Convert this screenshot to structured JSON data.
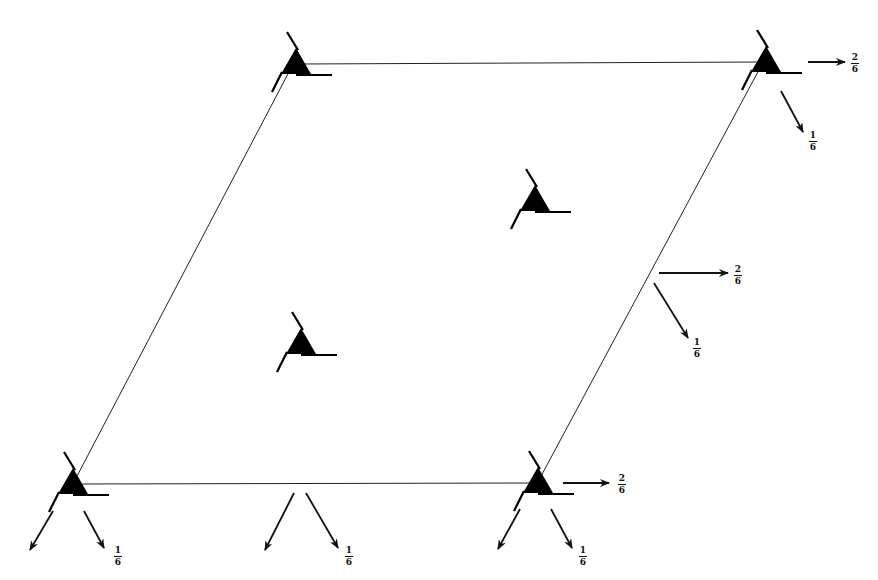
{
  "diagram": {
    "type": "lattice-cell-symmetry",
    "cell": {
      "corners": {
        "top_left": [
          291,
          64
        ],
        "top_right": [
          763,
          64
        ],
        "bottom_right": [
          535,
          484
        ],
        "bottom_left": [
          72,
          484
        ]
      },
      "stroke_color": "#222222"
    },
    "symmetry_markers": [
      {
        "id": "corner-top-left",
        "position": [
          295,
          62
        ]
      },
      {
        "id": "corner-top-right",
        "position": [
          765,
          62
        ]
      },
      {
        "id": "corner-bottom-left",
        "position": [
          72,
          482
        ]
      },
      {
        "id": "corner-bottom-right",
        "position": [
          537,
          482
        ]
      },
      {
        "id": "interior-upper",
        "position": [
          534,
          200
        ]
      },
      {
        "id": "interior-lower",
        "position": [
          300,
          342
        ]
      }
    ],
    "vectors": [
      {
        "id": "tr-horizontal",
        "from": [
          808,
          62
        ],
        "to": [
          845,
          62
        ],
        "label": {
          "num": "2",
          "den": "6"
        },
        "label_pos": [
          850,
          55
        ]
      },
      {
        "id": "tr-diagonal",
        "from": [
          781,
          91
        ],
        "to": [
          803,
          132
        ],
        "label": {
          "num": "1",
          "den": "6"
        },
        "label_pos": [
          808,
          135
        ]
      },
      {
        "id": "mid-horizontal",
        "from": [
          659,
          273
        ],
        "to": [
          728,
          273
        ],
        "label": {
          "num": "2",
          "den": "6"
        },
        "label_pos": [
          733,
          266
        ]
      },
      {
        "id": "mid-diagonal",
        "from": [
          654,
          283
        ],
        "to": [
          688,
          338
        ],
        "label": {
          "num": "1",
          "den": "6"
        },
        "label_pos": [
          692,
          341
        ]
      },
      {
        "id": "bl-left",
        "from": [
          53,
          511
        ],
        "to": [
          30,
          550
        ],
        "label": null
      },
      {
        "id": "bl-right",
        "from": [
          84,
          511
        ],
        "to": [
          104,
          548
        ],
        "label": {
          "num": "1",
          "den": "6"
        },
        "label_pos": [
          113,
          549
        ]
      },
      {
        "id": "bm-left",
        "from": [
          294,
          493
        ],
        "to": [
          265,
          550
        ],
        "label": null
      },
      {
        "id": "bm-right",
        "from": [
          306,
          493
        ],
        "to": [
          338,
          548
        ],
        "label": {
          "num": "1",
          "den": "6"
        },
        "label_pos": [
          344,
          549
        ]
      },
      {
        "id": "br-horizontal",
        "from": [
          563,
          483
        ],
        "to": [
          609,
          483
        ],
        "label": {
          "num": "2",
          "den": "6"
        },
        "label_pos": [
          617,
          476
        ]
      },
      {
        "id": "br-left",
        "from": [
          520,
          509
        ],
        "to": [
          498,
          549
        ],
        "label": null
      },
      {
        "id": "br-right",
        "from": [
          551,
          509
        ],
        "to": [
          572,
          548
        ],
        "label": {
          "num": "1",
          "den": "6"
        },
        "label_pos": [
          579,
          549
        ]
      }
    ],
    "colors": {
      "ink": "#111111",
      "background": "#ffffff"
    }
  }
}
